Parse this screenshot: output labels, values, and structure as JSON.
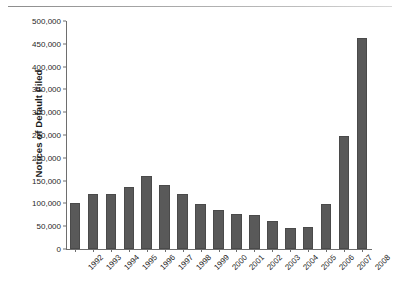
{
  "chart_data": {
    "type": "bar",
    "title": "",
    "xlabel": "",
    "ylabel": "Notices of Default Filed",
    "categories": [
      "1992",
      "1993",
      "1994",
      "1995",
      "1996",
      "1997",
      "1998",
      "1999",
      "2000",
      "2001",
      "2002",
      "2003",
      "2004",
      "2005",
      "2006",
      "2007",
      "2008"
    ],
    "values": [
      101000,
      121000,
      121500,
      135000,
      161000,
      140000,
      121000,
      99000,
      85000,
      77000,
      75000,
      61000,
      47000,
      48500,
      99000,
      248000,
      463000
    ],
    "ylim": [
      0,
      500000
    ],
    "ytick_values": [
      0,
      50000,
      100000,
      150000,
      200000,
      250000,
      300000,
      350000,
      400000,
      450000,
      500000
    ],
    "ytick_labels": [
      "0",
      "50,000",
      "100,000",
      "150,000",
      "200,000",
      "250,000",
      "300,000",
      "350,000",
      "400,000",
      "450,000",
      "500,000"
    ],
    "grid": false,
    "legend": null,
    "bar_color": "#595959",
    "axis_color": "#6e6e6e",
    "background_color": "#ffffff"
  }
}
